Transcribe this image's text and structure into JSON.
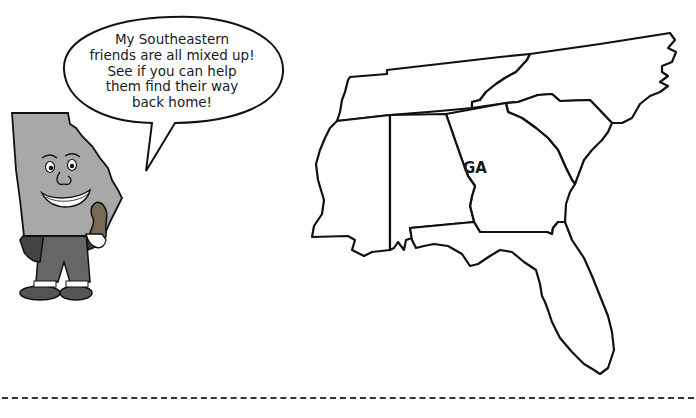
{
  "speech_bubble": {
    "lines": [
      "My Southeastern",
      "friends are all mixed up!",
      "See if you can help",
      "them find their way",
      "back home!"
    ]
  },
  "character": {
    "description": "Georgia state mascot holding a peanut"
  },
  "map": {
    "states": [
      {
        "id": "TN",
        "label": ""
      },
      {
        "id": "NC",
        "label": ""
      },
      {
        "id": "SC",
        "label": ""
      },
      {
        "id": "MS",
        "label": ""
      },
      {
        "id": "AL",
        "label": ""
      },
      {
        "id": "GA",
        "label": "GA"
      },
      {
        "id": "FL",
        "label": ""
      }
    ]
  },
  "colors": {
    "outline": "#111111",
    "mascot_fill": "#a8a8a8",
    "clothing": "#555555"
  }
}
